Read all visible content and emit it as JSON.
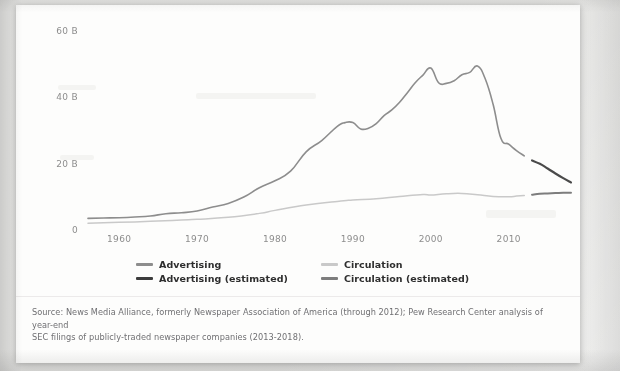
{
  "chart_data": {
    "type": "line",
    "title": "",
    "xlabel": "",
    "ylabel": "",
    "xlim": [
      1956,
      2018
    ],
    "ylim": [
      0,
      65
    ],
    "grid": false,
    "legend_position": "bottom",
    "y_ticks": [
      {
        "value": 0,
        "label": "0"
      },
      {
        "value": 20,
        "label": "20 B"
      },
      {
        "value": 40,
        "label": "40 B"
      },
      {
        "value": 60,
        "label": "60 B"
      }
    ],
    "x_ticks": [
      {
        "value": 1960,
        "label": "1960"
      },
      {
        "value": 1970,
        "label": "1970"
      },
      {
        "value": 1980,
        "label": "1980"
      },
      {
        "value": 1990,
        "label": "1990"
      },
      {
        "value": 2000,
        "label": "2000"
      },
      {
        "value": 2010,
        "label": "2010"
      }
    ],
    "series": [
      {
        "name": "Advertising",
        "color": "#8d8d8d",
        "width": 1.6,
        "x": [
          1956,
          1958,
          1960,
          1962,
          1964,
          1966,
          1968,
          1970,
          1972,
          1974,
          1976,
          1978,
          1980,
          1982,
          1984,
          1986,
          1988,
          1989,
          1990,
          1991,
          1992,
          1993,
          1994,
          1995,
          1996,
          1997,
          1998,
          1999,
          2000,
          2001,
          2002,
          2003,
          2004,
          2005,
          2006,
          2007,
          2008,
          2009,
          2010,
          2011,
          2012
        ],
        "y": [
          3.5,
          3.6,
          3.7,
          3.9,
          4.2,
          4.9,
          5.2,
          5.7,
          6.9,
          8.0,
          9.9,
          12.7,
          14.8,
          17.7,
          23.5,
          26.9,
          31.2,
          32.3,
          32.3,
          30.4,
          30.6,
          32.0,
          34.4,
          36.1,
          38.4,
          41.3,
          44.3,
          46.6,
          48.7,
          44.3,
          44.1,
          44.9,
          46.7,
          47.4,
          49.3,
          45.4,
          37.8,
          27.6,
          25.8,
          23.9,
          22.3
        ]
      },
      {
        "name": "Advertising (estimated)",
        "color": "#4a4a4a",
        "width": 2.2,
        "x": [
          2013,
          2014,
          2015,
          2016,
          2017,
          2018
        ],
        "y": [
          20.9,
          19.9,
          18.5,
          17.0,
          15.6,
          14.3
        ]
      },
      {
        "name": "Circulation",
        "color": "#c9c9c9",
        "width": 1.5,
        "x": [
          1956,
          1960,
          1964,
          1968,
          1970,
          1974,
          1978,
          1980,
          1984,
          1988,
          1990,
          1993,
          1996,
          1999,
          2000,
          2002,
          2004,
          2006,
          2008,
          2010,
          2011,
          2012
        ],
        "y": [
          2.0,
          2.3,
          2.6,
          3.0,
          3.2,
          3.8,
          5.0,
          5.9,
          7.5,
          8.6,
          9.0,
          9.4,
          10.1,
          10.7,
          10.5,
          10.9,
          11.0,
          10.6,
          10.1,
          10.0,
          10.2,
          10.4
        ]
      },
      {
        "name": "Circulation (estimated)",
        "color": "#7d7d7d",
        "width": 2.0,
        "x": [
          2013,
          2014,
          2015,
          2016,
          2017,
          2018
        ],
        "y": [
          10.6,
          10.9,
          11.0,
          11.1,
          11.2,
          11.2
        ]
      }
    ],
    "legend": [
      {
        "label": "Advertising",
        "color": "#8d8d8d"
      },
      {
        "label": "Circulation",
        "color": "#c9c9c9"
      },
      {
        "label": "Advertising (estimated)",
        "color": "#3c3c3c"
      },
      {
        "label": "Circulation (estimated)",
        "color": "#7d7d7d"
      }
    ]
  },
  "source": {
    "line1": "Source: News Media Alliance, formerly Newspaper Association of America (through 2012); Pew Research Center analysis of year-end",
    "line2": "SEC filings of publicly-traded newspaper companies (2013-2018)."
  }
}
